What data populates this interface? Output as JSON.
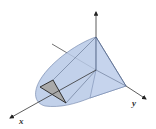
{
  "diagram": {
    "type": "3d-solid-region",
    "axes": {
      "x": {
        "label": "x"
      },
      "y": {
        "label": "y"
      },
      "z": {
        "label": ""
      }
    },
    "colors": {
      "solid_fill": "#b7c9e6",
      "solid_fill_light": "#d3dff1",
      "edge": "#4a5a78",
      "cross_section": "#a9a9a9",
      "axis": "#333333"
    }
  }
}
